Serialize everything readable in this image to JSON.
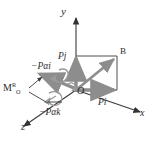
{
  "figure": {
    "background_color": "#ffffff",
    "axis_color": "#333333",
    "vector_color": "#8d8d8d",
    "label_color": "#2b2b2b"
  },
  "axes": [
    {
      "name": "y-axis",
      "label": "y",
      "direction": "up"
    },
    {
      "name": "x-axis",
      "label": "x",
      "direction": "right-down"
    },
    {
      "name": "z-axis",
      "label": "z",
      "direction": "left-down"
    }
  ],
  "points": [
    {
      "name": "origin",
      "label": "O"
    },
    {
      "name": "corner-b",
      "label": "B"
    }
  ],
  "vectors": [
    {
      "name": "vector-pi",
      "label": "Pi",
      "color": "#8d8d8d"
    },
    {
      "name": "vector-pj",
      "label": "Pj",
      "color": "#8d8d8d"
    },
    {
      "name": "vector-r",
      "label": "R",
      "color": "#8d8d8d"
    }
  ],
  "moments": [
    {
      "name": "moment-resultant",
      "label": "M",
      "superscript": "R",
      "subscript": "O"
    },
    {
      "name": "moment-pai",
      "label": "−Pαi"
    },
    {
      "name": "moment-pak",
      "label": "−Pαk"
    }
  ],
  "labels": {
    "y": "y",
    "x": "x",
    "z": "z",
    "O": "O",
    "B": "B",
    "Pi": "Pi",
    "Pj": "Pj",
    "M": "M",
    "M_sup": "R",
    "M_sub": "O",
    "minus_pai": "−Pαi",
    "minus_pak": "−Pαk"
  }
}
